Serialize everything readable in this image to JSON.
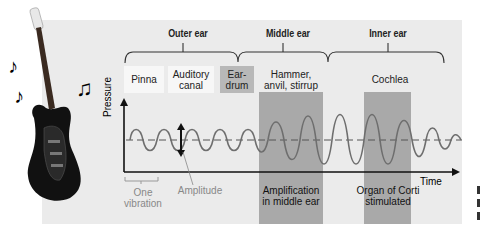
{
  "sections": {
    "outer_ear": "Outer ear",
    "middle_ear": "Middle ear",
    "inner_ear": "Inner ear"
  },
  "parts": [
    {
      "line1": "Pinna",
      "line2": ""
    },
    {
      "line1": "Auditory",
      "line2": "canal"
    },
    {
      "line1": "Ear-",
      "line2": "drum"
    },
    {
      "line1": "Hammer,",
      "line2": "anvil, stirrup"
    },
    {
      "line1": "Cochlea",
      "line2": ""
    }
  ],
  "axes": {
    "y_label": "Pressure",
    "x_label": "Time"
  },
  "annotations": {
    "one_vibration_1": "One",
    "one_vibration_2": "vibration",
    "amplitude": "Amplitude",
    "amplification_1": "Amplification",
    "amplification_2": "in middle ear",
    "corti_1": "Organ of Corti",
    "corti_2": "stimulated"
  },
  "colors": {
    "panel_bg": "#ebebeb",
    "shade_band": "#a9a9a9",
    "eardrum_box": "#b8b8b8",
    "white_box": "#f7f7f7",
    "wave": "#6e6e6e",
    "grey_text": "#888888"
  },
  "decor": {
    "note1": "♪",
    "note2": "♪",
    "note3": "♫"
  }
}
